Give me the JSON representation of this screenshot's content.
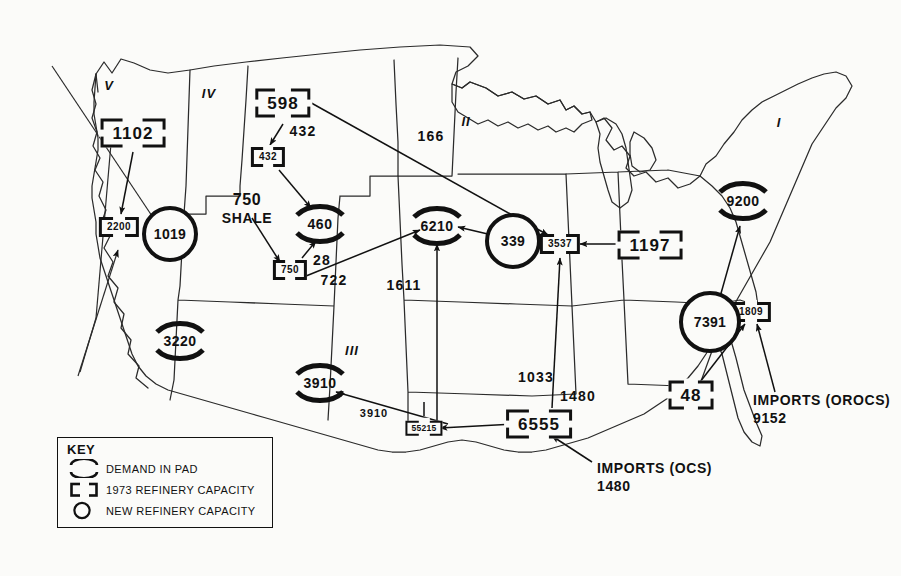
{
  "key": {
    "title": "KEY",
    "items": [
      {
        "glyph": "broken-circle",
        "label": "DEMAND IN PAD"
      },
      {
        "glyph": "broken-rect",
        "label": "1973 REFINERY CAPACITY"
      },
      {
        "glyph": "solid-circle",
        "label": "NEW REFINERY CAPACITY"
      }
    ]
  },
  "regions": [
    {
      "id": "V",
      "label": "V",
      "x": 109,
      "y": 85
    },
    {
      "id": "IV",
      "label": "IV",
      "x": 209,
      "y": 93
    },
    {
      "id": "II",
      "label": "II",
      "x": 466,
      "y": 121
    },
    {
      "id": "I",
      "label": "I",
      "x": 779,
      "y": 122
    },
    {
      "id": "III",
      "label": "III",
      "x": 352,
      "y": 350
    }
  ],
  "demand_in_pad": [
    {
      "name": "pad-v-demand-460",
      "value": "460",
      "x": 320,
      "y": 224
    },
    {
      "name": "pad-ii-demand-6210",
      "value": "6210",
      "x": 437,
      "y": 226
    },
    {
      "name": "pad-v-demand-3220",
      "value": "3220",
      "x": 180,
      "y": 341
    },
    {
      "name": "pad-iii-demand-3910",
      "value": "3910",
      "x": 320,
      "y": 383
    },
    {
      "name": "pad-i-demand-9200",
      "value": "9200",
      "x": 743,
      "y": 201
    }
  ],
  "refinery_capacity_1973": [
    {
      "name": "refinery-1102",
      "value": "1102",
      "x": 133,
      "y": 133,
      "size": "large"
    },
    {
      "name": "refinery-598",
      "value": "598",
      "x": 283,
      "y": 103,
      "size": "large"
    },
    {
      "name": "refinery-1197",
      "value": "1197",
      "x": 650,
      "y": 245,
      "size": "large"
    },
    {
      "name": "refinery-48",
      "value": "48",
      "x": 691,
      "y": 395,
      "size": "large"
    },
    {
      "name": "refinery-6555",
      "value": "6555",
      "x": 539,
      "y": 424,
      "size": "large"
    },
    {
      "name": "refinery-2200",
      "value": "2200",
      "x": 119,
      "y": 227,
      "size": "small"
    },
    {
      "name": "refinery-432",
      "value": "432",
      "x": 268,
      "y": 157,
      "size": "small"
    },
    {
      "name": "refinery-750",
      "value": "750",
      "x": 290,
      "y": 270,
      "size": "small"
    },
    {
      "name": "refinery-3537",
      "value": "3537",
      "x": 560,
      "y": 244,
      "size": "small"
    },
    {
      "name": "refinery-1809",
      "value": "1809",
      "x": 751,
      "y": 312,
      "size": "small"
    },
    {
      "name": "refinery-55215",
      "value": "55215",
      "x": 424,
      "y": 428,
      "size": "tiny"
    }
  ],
  "new_refinery_capacity": [
    {
      "name": "new-refinery-1019",
      "value": "1019",
      "x": 170,
      "y": 234
    },
    {
      "name": "new-refinery-339",
      "value": "339",
      "x": 513,
      "y": 241
    },
    {
      "name": "new-refinery-7391",
      "value": "7391",
      "x": 710,
      "y": 322
    }
  ],
  "flow_labels": [
    {
      "name": "flow-432",
      "value": "432",
      "x": 303,
      "y": 131
    },
    {
      "name": "flow-166",
      "value": "166",
      "x": 431,
      "y": 136
    },
    {
      "name": "flow-28",
      "value": "28",
      "x": 322,
      "y": 260
    },
    {
      "name": "flow-722",
      "value": "722",
      "x": 334,
      "y": 280
    },
    {
      "name": "flow-1611",
      "value": "1611",
      "x": 404,
      "y": 285
    },
    {
      "name": "flow-1033",
      "value": "1033",
      "x": 536,
      "y": 377
    },
    {
      "name": "flow-1480",
      "value": "1480",
      "x": 578,
      "y": 396
    },
    {
      "name": "flow-3910",
      "value": "3910",
      "x": 374,
      "y": 413,
      "small": true
    }
  ],
  "annotations": [
    {
      "name": "shale-annotation",
      "line1": "750",
      "line2": "SHALE",
      "x": 247,
      "y": 198,
      "align": "center"
    },
    {
      "name": "imports-ocs-annotation",
      "line1": "IMPORTS (OCS)",
      "line2": "1480",
      "x": 597,
      "y": 468,
      "align": "left"
    },
    {
      "name": "imports-orocs-annotation",
      "line1": "IMPORTS (OROCS)",
      "line2": "9152",
      "x": 753,
      "y": 400,
      "align": "left"
    }
  ]
}
